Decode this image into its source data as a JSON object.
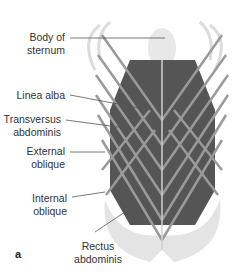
{
  "figure": {
    "panel_letter": "a",
    "labels": [
      {
        "id": "body-of-sternum",
        "line1": "Body of",
        "line2": "sternum"
      },
      {
        "id": "linea-alba",
        "line1": "Linea alba",
        "line2": ""
      },
      {
        "id": "transversus-abdominis",
        "line1": "Transversus",
        "line2": "abdominis"
      },
      {
        "id": "external-oblique",
        "line1": "External",
        "line2": "oblique"
      },
      {
        "id": "internal-oblique",
        "line1": "Internal",
        "line2": "oblique"
      },
      {
        "id": "rectus-abdominis",
        "line1": "Rectus",
        "line2": "abdominis"
      }
    ],
    "colors": {
      "bone": "#e6e6e6",
      "muscle_dark": "#5a5a5a",
      "muscle_band": "#8c8c8c",
      "leader_line": "#555555",
      "text": "#333333"
    }
  }
}
